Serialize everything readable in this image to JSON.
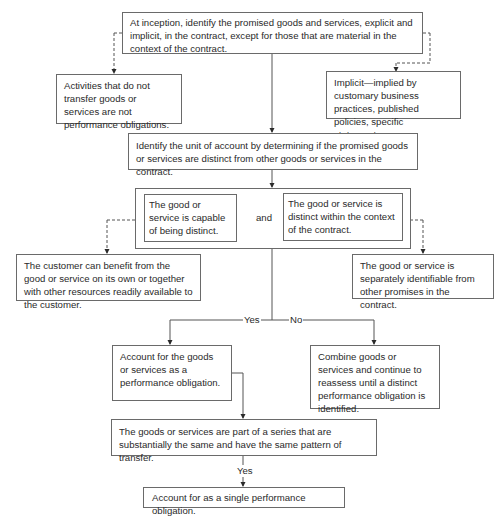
{
  "flowchart": {
    "step1": "At inception, identify the promised goods and services, explicit and implicit, in the contract, except for those that are material in the context of the contract.",
    "side_left_1": "Activities that do not transfer goods or services are not performance obligations.",
    "side_right_1": "Implicit—implied by customary business practices, published policies, specific statements.",
    "step2": "Identify the unit of account by determining if the promised goods or services are distinct from other goods or services in the contract.",
    "criteria": {
      "left": "The good or service is capable of being distinct.",
      "connector": "and",
      "right": "The good or service is distinct within the context of the contract."
    },
    "side_left_2": "The customer can benefit from the good or service on its own or together with other resources readily available to the customer.",
    "side_right_2": "The good or service is separately identifiable from other promises in the contract.",
    "branch_yes": "Yes",
    "branch_no": "No",
    "outcome_yes": "Account for the goods or services as a performance obligation.",
    "outcome_no": "Combine goods or services and continue to reassess until a distinct performance obligation is identified.",
    "series_check": "The goods or services are part of a series that are substantially the same and have the same pattern of transfer.",
    "series_yes": "Yes",
    "final": "Account for as a single performance obligation."
  }
}
